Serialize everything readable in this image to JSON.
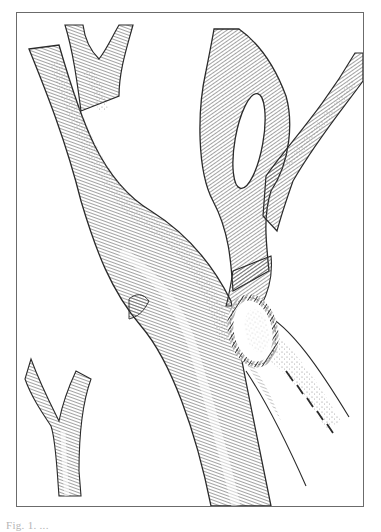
{
  "figure": {
    "type": "surgical-illustration",
    "style": "pen-and-ink hatching",
    "colors": {
      "ink": "#2a2a2a",
      "hatch": "#555555",
      "stipple": "#8a8a8a",
      "frame": "#6b6b6b",
      "paper": "#ffffff"
    },
    "elements": {
      "main_vessel": "trunk running from upper-left to bottom-center",
      "upper_left_bifurcation": "Y-shaped fork at top-left",
      "upper_right_loop": "vessel loop with oval opening at top-right",
      "upper_right_branch": "branch exiting to top-right corner",
      "lower_left_branch": "Y-fork vessel at lower-left",
      "anastomosis": "oval suture line (braided) at junction",
      "graft": "tube exiting to lower-right with dashed marking line",
      "stump_nub": "small hatched stump on left of main trunk"
    }
  },
  "caption": {
    "text": "Fig. 1. ...",
    "visible": "clipped at bottom edge; text not legible"
  }
}
